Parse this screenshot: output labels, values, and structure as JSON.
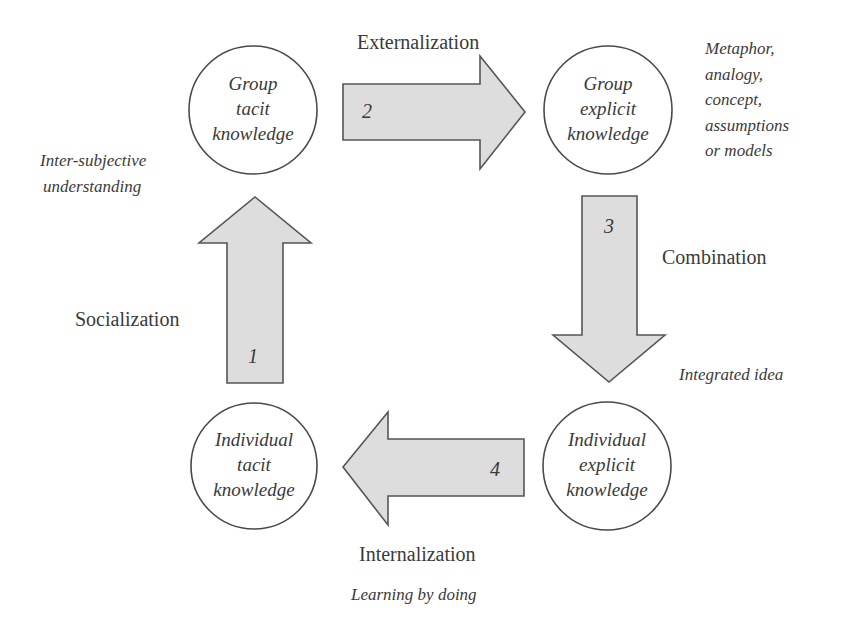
{
  "diagram": {
    "type": "knowledge-conversion-cycle",
    "nodes": [
      {
        "id": "group-tacit",
        "lines": [
          "Group",
          "tacit",
          "knowledge"
        ]
      },
      {
        "id": "group-explicit",
        "lines": [
          "Group",
          "explicit",
          "knowledge"
        ]
      },
      {
        "id": "individual-tacit",
        "lines": [
          "Individual",
          "tacit",
          "knowledge"
        ]
      },
      {
        "id": "individual-explicit",
        "lines": [
          "Individual",
          "explicit",
          "knowledge"
        ]
      }
    ],
    "arrows": [
      {
        "number": "1",
        "mode": "Socialization",
        "from": "individual-tacit",
        "to": "group-tacit",
        "direction": "up"
      },
      {
        "number": "2",
        "mode": "Externalization",
        "from": "group-tacit",
        "to": "group-explicit",
        "direction": "right"
      },
      {
        "number": "3",
        "mode": "Combination",
        "from": "group-explicit",
        "to": "individual-explicit",
        "direction": "down"
      },
      {
        "number": "4",
        "mode": "Internalization",
        "from": "individual-explicit",
        "to": "individual-tacit",
        "direction": "left"
      }
    ],
    "notes": {
      "socialization": [
        "Inter-subjective",
        "understanding"
      ],
      "externalization": [
        "Metaphor,",
        "analogy,",
        "concept,",
        "assumptions",
        "or models"
      ],
      "combination": "Integrated idea",
      "internalization": "Learning by doing"
    }
  },
  "style": {
    "arrow_fill": "#dddddd",
    "arrow_stroke": "#555555",
    "circle_stroke": "#4a4a4a",
    "text_color": "#3a3a3a"
  }
}
